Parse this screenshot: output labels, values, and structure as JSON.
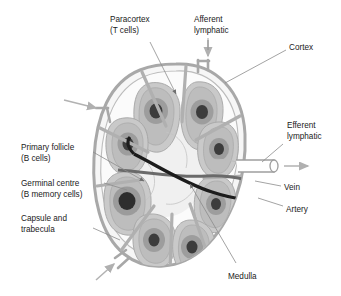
{
  "figure": {
    "background_color": "#ffffff"
  },
  "labels": {
    "paracortex_line1": "Paracortex",
    "paracortex_line2": "(T cells)",
    "afferent_line1": "Afferent",
    "afferent_line2": "lymphatic",
    "cortex": "Cortex",
    "efferent_line1": "Efferent",
    "efferent_line2": "lymphatic",
    "primary_follicle_line1": "Primary follicle",
    "primary_follicle_line2": "(B cells)",
    "germinal_centre_line1": "Germinal centre",
    "germinal_centre_line2": "(B memory cells)",
    "capsule_line1": "Capsule and",
    "capsule_line2": "trabecula",
    "vein": "Vein",
    "artery": "Artery",
    "medulla": "Medulla"
  },
  "colors": {
    "capsule": "#a8a8a8",
    "trabecula": "#b0b0b0",
    "node_fill": "#f4f4f4",
    "cortex_fill": "#fafafa",
    "follicle_body": "#c9c9c9",
    "follicle_mid": "#b4b4b4",
    "germinal_ring": "#9a9a9a",
    "germinal_core": "#4a4a4a",
    "medulla_fill": "#d6d6d6",
    "artery": "#1c1c1c",
    "vein": "#555555",
    "leader_line": "#8c8c8c",
    "arrow_gray": "#b5b5b5",
    "text": "#1a1a1a"
  },
  "structures": {
    "follicle_count": 8,
    "afferent_arrow_count": 3,
    "efferent_vessel_label": "efferent lymphatic duct with outflow arrow"
  }
}
